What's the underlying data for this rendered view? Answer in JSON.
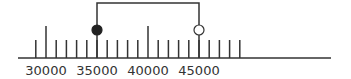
{
  "number_line": {
    "min": 28000,
    "max": 50000,
    "tick_step": 1000,
    "label_values": [
      30000,
      35000,
      40000,
      45000
    ],
    "labels": [
      "30000",
      "35000",
      "40000",
      "45000"
    ],
    "major_ticks": [
      30000,
      40000
    ],
    "minor_ticks": [
      29000,
      31000,
      32000,
      33000,
      34000,
      35000,
      36000,
      37000,
      38000,
      39000,
      41000,
      42000,
      43000,
      44000,
      45000,
      46000,
      47000,
      48000,
      49000
    ],
    "interval": {
      "start": 35000,
      "start_marker": "closed-circle",
      "end": 45000,
      "end_marker": "open-circle"
    },
    "colors": {
      "line": "#333333",
      "fill": "#222222",
      "label": "#333333"
    }
  }
}
